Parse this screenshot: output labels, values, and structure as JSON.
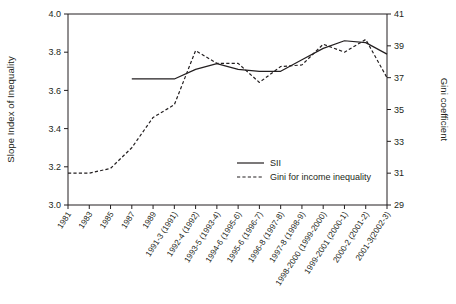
{
  "chart_data": {
    "type": "line",
    "title": "",
    "xlabel": "",
    "ylabel": "Slope Index of Inequality",
    "y2label": "Gini coefficient",
    "grid": false,
    "legend_position": "inside-bottom-right",
    "ylim": [
      3.0,
      4.0
    ],
    "y2lim": [
      29,
      41
    ],
    "yticks": [
      "3.0",
      "3.2",
      "3.4",
      "3.6",
      "3.8",
      "4.0"
    ],
    "y2ticks": [
      "29",
      "31",
      "33",
      "35",
      "37",
      "39",
      "41"
    ],
    "categories": [
      "1981",
      "1983",
      "1985",
      "1987",
      "1989",
      "1991-3 (1991)",
      "1992-4 (1992)",
      "1993-5 (1993-4)",
      "1994-6 (1995-6)",
      "1995-6 (1996-7)",
      "1996-8 (1997-8)",
      "1997-8 (1998-9)",
      "1998-2000 (1999-2000)",
      "1999-2001 (2000-1)",
      "2000-2 (2001-2)",
      "2001-3(2002-3)"
    ],
    "series": [
      {
        "name": "SII",
        "axis": "left",
        "style": "solid",
        "values": [
          null,
          null,
          null,
          3.66,
          3.66,
          3.66,
          3.71,
          3.74,
          3.71,
          3.7,
          3.7,
          3.76,
          3.82,
          3.86,
          3.85,
          3.79
        ]
      },
      {
        "name": "Gini for income inequality",
        "axis": "right",
        "style": "dashed",
        "values": [
          31.0,
          31.0,
          31.3,
          32.6,
          34.5,
          35.3,
          38.7,
          37.9,
          37.9,
          36.7,
          37.7,
          37.8,
          39.1,
          38.6,
          39.4,
          37.0
        ]
      }
    ],
    "legend": [
      {
        "label": "SII",
        "style": "solid"
      },
      {
        "label": "Gini for income inequality",
        "style": "dashed"
      }
    ]
  }
}
